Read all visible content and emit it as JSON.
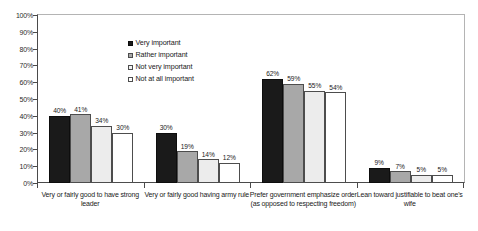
{
  "chart_data": {
    "type": "bar",
    "title": "",
    "subtitle": "",
    "xlabel": "",
    "ylabel": "",
    "ylim": [
      0,
      100
    ],
    "y_ticks": [
      "0%",
      "10%",
      "20%",
      "30%",
      "40%",
      "50%",
      "60%",
      "70%",
      "80%",
      "90%",
      "100%"
    ],
    "grid": false,
    "legend_position": "upper-center",
    "value_suffix": "%",
    "categories": [
      "Very or fairly good to have strong leader",
      "Very or fairly good having army rule",
      "Prefer government emphasize order (as opposed to respecting freedom)",
      "Lean toward justifiable to beat one's wife"
    ],
    "series": [
      {
        "name": "Very important",
        "color": "#1a1a1a",
        "values": [
          40,
          30,
          62,
          9
        ]
      },
      {
        "name": "Rather important",
        "color": "#a8a8a8",
        "values": [
          41,
          19,
          59,
          7
        ]
      },
      {
        "name": "Not very important",
        "color": "#ececec",
        "values": [
          34,
          14,
          55,
          5
        ]
      },
      {
        "name": "Not at all important",
        "color": "#ffffff",
        "values": [
          30,
          12,
          54,
          5
        ]
      }
    ],
    "data_labels": [
      [
        "40%",
        "41%",
        "34%",
        "30%"
      ],
      [
        "30%",
        "19%",
        "14%",
        "12%"
      ],
      [
        "62%",
        "59%",
        "55%",
        "54%"
      ],
      [
        "9%",
        "7%",
        "5%",
        "5%"
      ]
    ]
  }
}
